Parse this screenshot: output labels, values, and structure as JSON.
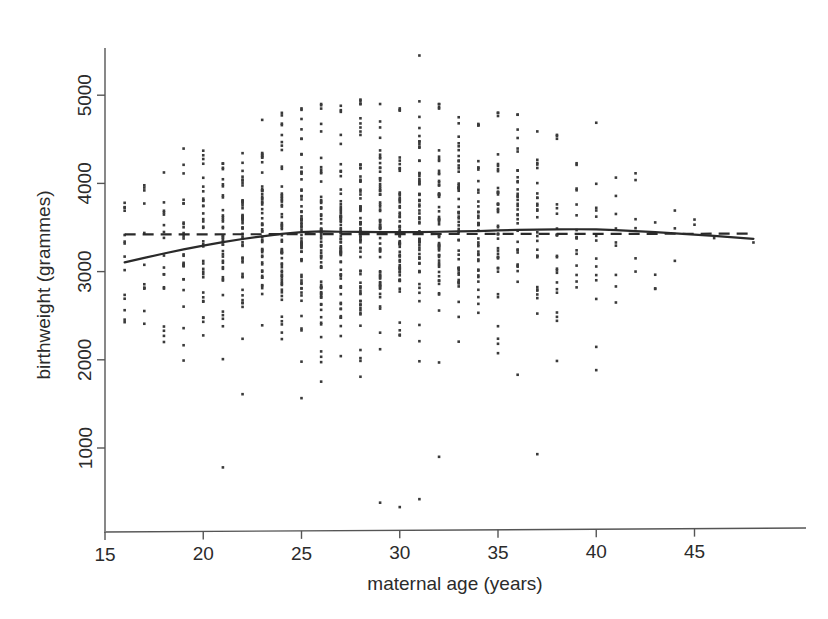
{
  "chart_data": {
    "type": "scatter",
    "title": "",
    "xlabel": "maternal age (years)",
    "ylabel": "birthweight (grammes)",
    "xlim": [
      14.2,
      48.6
    ],
    "ylim": [
      250,
      5600
    ],
    "grid": false,
    "legend": "none",
    "x_ticks": [
      15,
      20,
      25,
      30,
      35,
      40,
      45
    ],
    "x_tick_labels": [
      "15",
      "20",
      "25",
      "30",
      "35",
      "40",
      "45"
    ],
    "y_ticks": [
      1000,
      2000,
      3000,
      4000,
      5000
    ],
    "y_tick_labels": [
      "1000",
      "2000",
      "3000",
      "4000",
      "5000"
    ],
    "point_color": "#3a3a3a",
    "line_color": "#2a2a2a",
    "series": [
      {
        "name": "observations",
        "type": "scatter",
        "note": "birthweight in grammes by integer maternal age; counts per age column reflect sample density",
        "columns": [
          {
            "age": 16,
            "n": 14,
            "mean": 3150,
            "sd": 560,
            "min": 2250,
            "max": 3780
          },
          {
            "age": 17,
            "n": 12,
            "mean": 3200,
            "sd": 540,
            "min": 2400,
            "max": 3980
          },
          {
            "age": 18,
            "n": 18,
            "mean": 3230,
            "sd": 570,
            "min": 2150,
            "max": 4150
          },
          {
            "age": 19,
            "n": 26,
            "mean": 3260,
            "sd": 590,
            "min": 1650,
            "max": 4450
          },
          {
            "age": 20,
            "n": 34,
            "mean": 3300,
            "sd": 600,
            "min": 1300,
            "max": 4550
          },
          {
            "age": 21,
            "n": 40,
            "mean": 3320,
            "sd": 610,
            "min": 780,
            "max": 4600
          },
          {
            "age": 22,
            "n": 46,
            "mean": 3360,
            "sd": 600,
            "min": 1600,
            "max": 4700
          },
          {
            "age": 23,
            "n": 52,
            "mean": 3400,
            "sd": 610,
            "min": 1450,
            "max": 4720
          },
          {
            "age": 24,
            "n": 58,
            "mean": 3430,
            "sd": 600,
            "min": 1500,
            "max": 4800
          },
          {
            "age": 25,
            "n": 62,
            "mean": 3450,
            "sd": 610,
            "min": 1420,
            "max": 4850
          },
          {
            "age": 26,
            "n": 66,
            "mean": 3450,
            "sd": 620,
            "min": 1350,
            "max": 4900
          },
          {
            "age": 27,
            "n": 68,
            "mean": 3440,
            "sd": 610,
            "min": 1250,
            "max": 4880
          },
          {
            "age": 28,
            "n": 70,
            "mean": 3450,
            "sd": 620,
            "min": 1200,
            "max": 4950
          },
          {
            "age": 29,
            "n": 66,
            "mean": 3440,
            "sd": 630,
            "min": 380,
            "max": 4900
          },
          {
            "age": 30,
            "n": 64,
            "mean": 3440,
            "sd": 620,
            "min": 330,
            "max": 4850
          },
          {
            "age": 31,
            "n": 60,
            "mean": 3450,
            "sd": 630,
            "min": 420,
            "max": 5450
          },
          {
            "age": 32,
            "n": 56,
            "mean": 3460,
            "sd": 620,
            "min": 900,
            "max": 4900
          },
          {
            "age": 33,
            "n": 50,
            "mean": 3450,
            "sd": 610,
            "min": 1400,
            "max": 4750
          },
          {
            "age": 34,
            "n": 44,
            "mean": 3470,
            "sd": 610,
            "min": 1550,
            "max": 4700
          },
          {
            "age": 35,
            "n": 40,
            "mean": 3480,
            "sd": 600,
            "min": 1600,
            "max": 4800
          },
          {
            "age": 36,
            "n": 34,
            "mean": 3490,
            "sd": 610,
            "min": 1500,
            "max": 4780
          },
          {
            "age": 37,
            "n": 28,
            "mean": 3480,
            "sd": 620,
            "min": 930,
            "max": 4600
          },
          {
            "age": 38,
            "n": 22,
            "mean": 3490,
            "sd": 600,
            "min": 1800,
            "max": 4550
          },
          {
            "age": 39,
            "n": 16,
            "mean": 3500,
            "sd": 590,
            "min": 1950,
            "max": 4500
          },
          {
            "age": 40,
            "n": 14,
            "mean": 3490,
            "sd": 600,
            "min": 1830,
            "max": 4700
          },
          {
            "age": 41,
            "n": 9,
            "mean": 3470,
            "sd": 580,
            "min": 2300,
            "max": 4250
          },
          {
            "age": 42,
            "n": 6,
            "mean": 3450,
            "sd": 550,
            "min": 2600,
            "max": 4150
          },
          {
            "age": 43,
            "n": 4,
            "mean": 3430,
            "sd": 520,
            "min": 2750,
            "max": 3900
          },
          {
            "age": 44,
            "n": 3,
            "mean": 3420,
            "sd": 500,
            "min": 2900,
            "max": 3800
          },
          {
            "age": 45,
            "n": 2,
            "mean": 3400,
            "sd": 420,
            "min": 3050,
            "max": 3720
          },
          {
            "age": 46,
            "n": 1,
            "mean": 3380,
            "sd": 0,
            "min": 3380,
            "max": 3380
          },
          {
            "age": 48,
            "n": 1,
            "mean": 3330,
            "sd": 0,
            "min": 3330,
            "max": 3330
          }
        ]
      },
      {
        "name": "smooth fit (solid)",
        "type": "line",
        "style": "solid",
        "x": [
          16,
          17,
          18,
          19,
          20,
          21,
          22,
          23,
          24,
          25,
          26,
          27,
          28,
          29,
          30,
          31,
          32,
          33,
          34,
          35,
          36,
          37,
          38,
          39,
          40,
          41,
          42,
          43,
          44,
          45,
          46,
          47,
          48
        ],
        "y": [
          3105,
          3155,
          3205,
          3252,
          3295,
          3335,
          3370,
          3400,
          3428,
          3448,
          3455,
          3452,
          3450,
          3448,
          3447,
          3448,
          3452,
          3455,
          3460,
          3468,
          3472,
          3476,
          3478,
          3480,
          3478,
          3470,
          3460,
          3448,
          3434,
          3420,
          3404,
          3388,
          3372
        ]
      },
      {
        "name": "constant fit (dashed)",
        "type": "line",
        "style": "dashed",
        "x": [
          16,
          48
        ],
        "y": [
          3422,
          3430
        ]
      }
    ]
  }
}
